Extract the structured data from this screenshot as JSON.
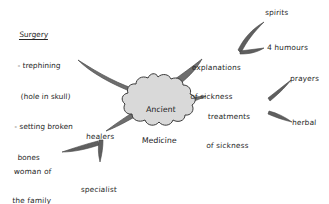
{
  "diagram": {
    "type": "mind-map",
    "style": "hand-drawn",
    "background_color": "#ffffff",
    "ink_color": "#262626",
    "branch_fill": "#6e6e6e",
    "node_fill": "#d9d9d9",
    "node_stroke": "#3a3a3a"
  },
  "center": {
    "label_line_1": "Ancient",
    "label_line_2": "Medicine"
  },
  "branches": [
    {
      "id": "surgery",
      "label": "Surgery",
      "note_lines": [
        "- trephining",
        "  (hole in skull)",
        "- setting broken",
        "  bones"
      ]
    },
    {
      "id": "explanations",
      "label_line_1": "explanations",
      "label_line_2": "of sickness",
      "children": [
        {
          "id": "spirits",
          "label": "spirits"
        },
        {
          "id": "four-humours",
          "label": "4 humours"
        }
      ]
    },
    {
      "id": "treatments",
      "label_line_1": "treatments",
      "label_line_2": "of sickness",
      "children": [
        {
          "id": "prayers",
          "label": "prayers"
        },
        {
          "id": "herbal",
          "label": "herbal"
        }
      ]
    },
    {
      "id": "healers",
      "label": "healers",
      "children": [
        {
          "id": "woman-of-the-family",
          "label_line_1": "woman of",
          "label_line_2": "the family"
        },
        {
          "id": "specialist-doctors",
          "label_line_1": "specialist",
          "label_line_2": "doctors"
        }
      ]
    }
  ]
}
